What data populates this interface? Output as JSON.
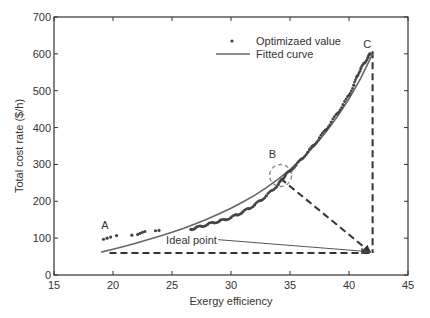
{
  "chart_data": {
    "type": "scatter",
    "title": "",
    "xlabel": "Exergy efficiency",
    "ylabel": "Total cost rate ($/h)",
    "xlim": [
      15,
      45
    ],
    "ylim": [
      0,
      700
    ],
    "xticks": [
      15,
      20,
      25,
      30,
      35,
      40,
      45
    ],
    "yticks": [
      0,
      100,
      200,
      300,
      400,
      500,
      600,
      700
    ],
    "grid": false,
    "legend": {
      "position": "upper-left-inside",
      "entries": [
        {
          "label": "Optimizaed value",
          "marker": "dot"
        },
        {
          "label": "Fitted curve",
          "marker": "line"
        }
      ]
    },
    "series": [
      {
        "name": "Optimizaed value",
        "type": "scatter",
        "points": [
          [
            19.2,
            97
          ],
          [
            19.5,
            100
          ],
          [
            19.8,
            103
          ],
          [
            20.3,
            107
          ],
          [
            21.6,
            108
          ],
          [
            22.1,
            110
          ],
          [
            22.3,
            113
          ],
          [
            22.5,
            116
          ],
          [
            22.7,
            118
          ],
          [
            23.6,
            120
          ],
          [
            23.9,
            121
          ],
          [
            26.6,
            124
          ],
          [
            27.0,
            128
          ],
          [
            27.5,
            132
          ],
          [
            28.0,
            137
          ],
          [
            28.5,
            142
          ],
          [
            29.0,
            146
          ],
          [
            29.5,
            150
          ],
          [
            30.0,
            156
          ],
          [
            30.5,
            163
          ],
          [
            31.0,
            171
          ],
          [
            31.5,
            180
          ],
          [
            32.0,
            190
          ],
          [
            32.5,
            202
          ],
          [
            33.0,
            215
          ],
          [
            33.5,
            230
          ],
          [
            34.0,
            245
          ],
          [
            34.3,
            258
          ],
          [
            34.6,
            270
          ],
          [
            35.0,
            282
          ],
          [
            35.5,
            298
          ],
          [
            36.0,
            315
          ],
          [
            36.5,
            333
          ],
          [
            37.0,
            352
          ],
          [
            37.5,
            372
          ],
          [
            38.0,
            393
          ],
          [
            38.5,
            415
          ],
          [
            39.0,
            438
          ],
          [
            39.5,
            462
          ],
          [
            40.0,
            488
          ],
          [
            40.4,
            515
          ],
          [
            40.7,
            540
          ],
          [
            41.0,
            560
          ],
          [
            41.3,
            575
          ],
          [
            41.6,
            590
          ],
          [
            41.8,
            600
          ]
        ]
      },
      {
        "name": "Fitted curve",
        "type": "line",
        "points": [
          [
            19.0,
            62
          ],
          [
            20.0,
            70
          ],
          [
            21.0,
            78
          ],
          [
            22.0,
            87
          ],
          [
            23.0,
            96
          ],
          [
            24.0,
            106
          ],
          [
            25.0,
            116
          ],
          [
            26.0,
            127
          ],
          [
            27.0,
            139
          ],
          [
            28.0,
            152
          ],
          [
            29.0,
            166
          ],
          [
            30.0,
            181
          ],
          [
            31.0,
            198
          ],
          [
            32.0,
            216
          ],
          [
            33.0,
            237
          ],
          [
            34.0,
            260
          ],
          [
            35.0,
            286
          ],
          [
            36.0,
            315
          ],
          [
            37.0,
            348
          ],
          [
            38.0,
            386
          ],
          [
            39.0,
            429
          ],
          [
            40.0,
            478
          ],
          [
            41.0,
            534
          ],
          [
            42.0,
            600
          ]
        ]
      }
    ],
    "annotations": [
      {
        "label": "A",
        "x": 19.0,
        "y": 125
      },
      {
        "label": "B",
        "x": 33.2,
        "y": 318
      },
      {
        "label": "C",
        "x": 41.2,
        "y": 615
      },
      {
        "label": "Ideal point",
        "x": 24.5,
        "y": 85,
        "arrow_to": [
          41.8,
          63
        ]
      }
    ],
    "guides": [
      {
        "style": "dashed",
        "from": [
          19.7,
          60
        ],
        "to": [
          42.0,
          60
        ],
        "description": "horizontal dashed line from A-level min cost to ideal point"
      },
      {
        "style": "dashed",
        "from": [
          42.0,
          607
        ],
        "to": [
          42.0,
          60
        ],
        "description": "vertical dashed line from C to ideal point"
      },
      {
        "style": "dashed-arrow",
        "from": [
          34.2,
          262
        ],
        "to": [
          41.8,
          62
        ],
        "description": "dashed arrow from B to ideal point"
      },
      {
        "style": "dashed-circle",
        "center": [
          34.2,
          270
        ],
        "radius_px": 11,
        "description": "circle highlighting point B"
      }
    ],
    "ideal_point": {
      "x": 42.0,
      "y": 60
    }
  }
}
